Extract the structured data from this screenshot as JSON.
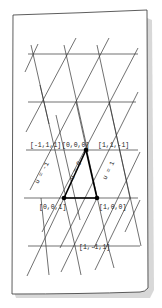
{
  "diagram": {
    "type": "triangular-lattice-sketch",
    "paper": {
      "color": "#ffffff",
      "stroke": "#333333",
      "shadow": "#bdbdbd"
    },
    "line_color": "#333333",
    "highlight_color": "#000000",
    "vertex_labels": [
      {
        "id": "v-m1-1-1",
        "text": "[-1,1,1]",
        "x": 36,
        "y": 147
      },
      {
        "id": "v-000",
        "text": "[0,0,0]",
        "x": 66,
        "y": 147
      },
      {
        "id": "v-11m1",
        "text": "[1,1,-1]",
        "x": 99,
        "y": 147
      },
      {
        "id": "v-001",
        "text": "[0,0,1]",
        "x": 41,
        "y": 209
      },
      {
        "id": "v-100",
        "text": "[1,0,0]",
        "x": 99,
        "y": 209
      },
      {
        "id": "v-1m11",
        "text": "[1,-1,1]",
        "x": 79,
        "y": 249
      }
    ],
    "edge_labels": [
      {
        "id": "u-minus1",
        "text": "u = -1",
        "x": 38,
        "y": 178,
        "angle": -62
      },
      {
        "id": "u-0",
        "text": "u = 0",
        "x": 70,
        "y": 176,
        "angle": -62
      },
      {
        "id": "u-1",
        "text": "u = 1",
        "x": 104,
        "y": 176,
        "angle": -62
      }
    ],
    "highlighted_triangle": {
      "vertices": [
        "[0,0,0]",
        "[0,0,1]",
        "[1,0,0]"
      ]
    }
  }
}
